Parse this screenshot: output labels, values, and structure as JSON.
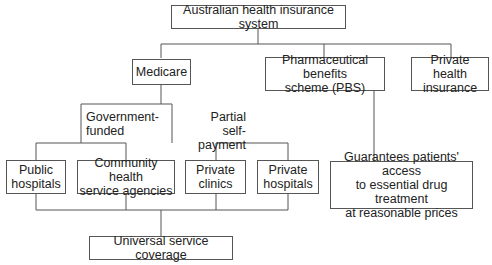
{
  "diagram": {
    "root": "Australian health insurance system",
    "level1": {
      "medicare": "Medicare",
      "pbs_line1": "Pharmaceutical benefits",
      "pbs_line2": "scheme (PBS)",
      "private_line1": "Private health",
      "private_line2": "insurance"
    },
    "branch_labels": {
      "gov_line1": "Government-",
      "gov_line2": "funded",
      "partial_line1": "Partial",
      "partial_line2": "self-payment"
    },
    "level2": {
      "public_line1": "Public",
      "public_line2": "hospitals",
      "community_line1": "Community health",
      "community_line2": "service agencies",
      "clinics_line1": "Private",
      "clinics_line2": "clinics",
      "privhosp_line1": "Private",
      "privhosp_line2": "hospitals"
    },
    "pbs_detail": {
      "line1": "Guarantees patients' access",
      "line2": "to essential drug treatment",
      "line3": "at reasonable prices"
    },
    "outcome": "Universal service coverage"
  }
}
